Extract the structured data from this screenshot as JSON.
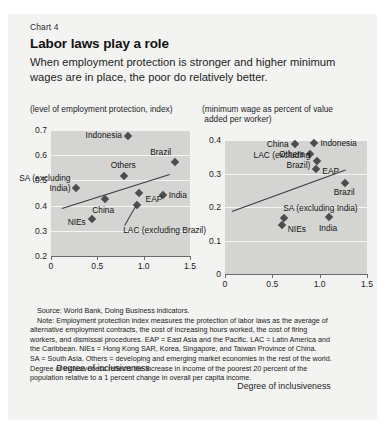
{
  "header": {
    "chart_number": "Chart 4",
    "title": "Labor laws play a role",
    "subtitle": "When employment protection is stronger and higher minimum wages are in place, the poor do relatively better."
  },
  "notes": {
    "source": "Source: World Bank, Doing Business indicators.",
    "note_line_1": "Note: Employment protection index measures the protection of labor laws as the average of",
    "note_line_2": "alternative employment contracts, the cost of increasing hours worked, the cost of firing",
    "note_line_3": "workers, and dismissal procedures. EAP = East Asia and the Pacific. LAC = Latin America and",
    "note_line_4": "the Caribbean. NIEs = Hong Kong SAR, Korea, Singapore, and Taiwan Province of China.",
    "note_line_5": "SA = South Asia. Others = developing and emerging market economies in the rest of the world.",
    "note_line_6": "Degree of inclusiveness reflects the increase in income of the poorest 20 percent of the",
    "note_line_7": "population relative to a 1 percent change in overall per capita income."
  },
  "chart_data": [
    {
      "id": "employment-protection",
      "type": "scatter",
      "title": "(level of employment protection, index)",
      "ylabel": "(level of employment protection, index)",
      "xlabel": "Degree of inclusiveness",
      "xlim": [
        0,
        1.5
      ],
      "ylim": [
        0.2,
        0.7
      ],
      "xticks": [
        "0",
        "0.5",
        "1.0",
        "1.5"
      ],
      "xtick_values": [
        0,
        0.5,
        1.0,
        1.5
      ],
      "yticks": [
        "0.2",
        "0.3",
        "0.4",
        "0.5",
        "0.6",
        "0.7"
      ],
      "ytick_values": [
        0.2,
        0.3,
        0.4,
        0.5,
        0.6,
        0.7
      ],
      "grid": true,
      "legend": "none",
      "points": [
        {
          "label": "Indonesia",
          "x": 0.83,
          "y": 0.675
        },
        {
          "label": "Brazil",
          "x": 1.34,
          "y": 0.573
        },
        {
          "label": "Others",
          "x": 0.79,
          "y": 0.518
        },
        {
          "label": "SA (excluding India)",
          "x": 0.275,
          "y": 0.468
        },
        {
          "label": "China",
          "x": 0.585,
          "y": 0.425
        },
        {
          "label": "India",
          "x": 1.205,
          "y": 0.442
        },
        {
          "label": "EAP",
          "x": 0.945,
          "y": 0.45
        },
        {
          "label": "LAC (excluding Brazil)",
          "x": 0.93,
          "y": 0.402
        },
        {
          "label": "NIEs",
          "x": 0.44,
          "y": 0.345
        }
      ],
      "trendline": {
        "x0": 0.12,
        "y0": 0.392,
        "x1": 1.28,
        "y1": 0.527
      }
    },
    {
      "id": "minimum-wage",
      "type": "scatter",
      "title": "(minimum wage as percent of value added per worker)",
      "ylabel": "(minimum wage as percent of value added per worker)",
      "xlabel": "Degree of inclusiveness",
      "xlim": [
        0,
        1.5
      ],
      "ylim": [
        0,
        0.4
      ],
      "xticks": [
        "0",
        "0.5",
        "1.0",
        "1.5"
      ],
      "xtick_values": [
        0,
        0.5,
        1.0,
        1.5
      ],
      "yticks": [
        "0",
        "0.1",
        "0.2",
        "0.3",
        "0.4"
      ],
      "ytick_values": [
        0,
        0.1,
        0.2,
        0.3,
        0.4
      ],
      "grid": true,
      "legend": "none",
      "points": [
        {
          "label": "China",
          "x": 0.735,
          "y": 0.388
        },
        {
          "label": "Indonesia",
          "x": 0.945,
          "y": 0.39
        },
        {
          "label": "Others",
          "x": 0.9,
          "y": 0.358
        },
        {
          "label": "LAC (excluding Brazil)",
          "x": 0.975,
          "y": 0.337
        },
        {
          "label": "EAP",
          "x": 0.965,
          "y": 0.312
        },
        {
          "label": "Brazil",
          "x": 1.27,
          "y": 0.272
        },
        {
          "label": "SA (excluding India)",
          "x": 0.625,
          "y": 0.168
        },
        {
          "label": "NIEs",
          "x": 0.6,
          "y": 0.145
        },
        {
          "label": "India",
          "x": 1.1,
          "y": 0.17
        }
      ],
      "trendline": {
        "x0": 0.07,
        "y0": 0.188,
        "x1": 1.27,
        "y1": 0.312
      }
    }
  ]
}
